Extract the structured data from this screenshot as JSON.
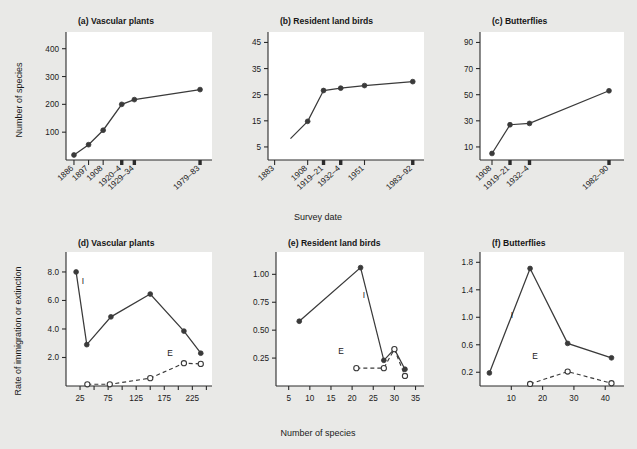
{
  "figure": {
    "background_color": "#e9e9e7",
    "plot_background_color": "#ffffff",
    "ink_color": "#3a3a3a",
    "shared_xlabel_top": "Survey date",
    "shared_xlabel_bottom": "Number of species",
    "ylabel_top": "Number of species",
    "ylabel_bottom": "Rate of immigration or extinction"
  },
  "chart_data": [
    {
      "id": "a",
      "type": "line",
      "title": "(a) Vascular plants",
      "xlabel": "Survey date",
      "ylabel": "Number of species",
      "categories": [
        "1886",
        "1897",
        "1908",
        "1920–4",
        "1929–34",
        "1979–83"
      ],
      "x": [
        1886,
        1897,
        1908,
        1922,
        1931.5,
        1981
      ],
      "values": [
        18,
        55,
        107,
        200,
        217,
        253
      ],
      "xlim": [
        1880,
        1990
      ],
      "ylim": [
        0,
        460
      ],
      "yticks": [
        100,
        200,
        300,
        400
      ],
      "ytick_labels": [
        "100",
        "200",
        "300",
        "400"
      ],
      "grid": false,
      "series": [
        {
          "name": "Number of species",
          "marker": "filled-circle",
          "line": "solid",
          "values": [
            18,
            55,
            107,
            200,
            217,
            253
          ]
        }
      ]
    },
    {
      "id": "b",
      "type": "line",
      "title": "(b) Resident land birds",
      "xlabel": "Survey date",
      "ylabel": "Number of species",
      "categories": [
        "1883",
        "1908",
        "1919–21",
        "1932–4",
        "1951",
        "1983–92"
      ],
      "x": [
        1883,
        1908,
        1920,
        1933,
        1951,
        1987.5
      ],
      "values": [
        null,
        14.8,
        26.6,
        27.5,
        28.5,
        30.0
      ],
      "note": "1883 point lies below the plotted axis range; the line enters from the lower left.",
      "xlim": [
        1878,
        1996
      ],
      "ylim": [
        0,
        49
      ],
      "yticks": [
        5,
        15,
        25,
        35,
        45
      ],
      "ytick_labels": [
        "5",
        "15",
        "25",
        "35",
        "45"
      ],
      "grid": false,
      "series": [
        {
          "name": "Number of species",
          "marker": "filled-circle",
          "line": "solid",
          "values": [
            null,
            14.8,
            26.6,
            27.5,
            28.5,
            30.0
          ]
        }
      ]
    },
    {
      "id": "c",
      "type": "line",
      "title": "(c) Butterflies",
      "xlabel": "Survey date",
      "ylabel": "Number of species",
      "categories": [
        "1908",
        "1919–21",
        "1932–4",
        "1982–90"
      ],
      "x": [
        1908,
        1920,
        1933,
        1986
      ],
      "values": [
        5,
        27,
        28,
        53
      ],
      "xlim": [
        1900,
        1996
      ],
      "ylim": [
        0,
        98
      ],
      "yticks": [
        10,
        30,
        50,
        70,
        90
      ],
      "ytick_labels": [
        "10",
        "30",
        "50",
        "70",
        "90"
      ],
      "grid": false,
      "series": [
        {
          "name": "Number of species",
          "marker": "filled-circle",
          "line": "solid",
          "values": [
            5,
            27,
            28,
            53
          ]
        }
      ]
    },
    {
      "id": "d",
      "type": "line",
      "title": "(d) Vascular plants",
      "xlabel": "Number of species",
      "ylabel": "Rate of immigration or extinction",
      "xlim": [
        0,
        260
      ],
      "ylim": [
        0,
        9.4
      ],
      "xticks": [
        25,
        75,
        125,
        175,
        225
      ],
      "xtick_labels": [
        "25",
        "75",
        "125",
        "175",
        "225"
      ],
      "xticks_minor": [
        50,
        100,
        150,
        200,
        250
      ],
      "yticks": [
        2.0,
        4.0,
        6.0,
        8.0
      ],
      "ytick_labels": [
        "2.0",
        "4.0",
        "6.0",
        "8.0"
      ],
      "grid": false,
      "series": [
        {
          "name": "I",
          "label": "I",
          "marker": "filled-circle",
          "line": "solid",
          "x": [
            18,
            37,
            80,
            150,
            210,
            240
          ],
          "values": [
            8.0,
            2.9,
            4.85,
            6.45,
            3.85,
            2.3
          ]
        },
        {
          "name": "E",
          "label": "E",
          "marker": "open-circle",
          "line": "dashed",
          "x": [
            38,
            78,
            150,
            210,
            240
          ],
          "values": [
            0.12,
            0.12,
            0.55,
            1.6,
            1.55
          ]
        }
      ]
    },
    {
      "id": "e",
      "type": "line",
      "title": "(e) Resident land birds",
      "xlabel": "Number of species",
      "ylabel": "Rate of immigration or extinction",
      "xlim": [
        2,
        37
      ],
      "ylim": [
        0,
        1.2
      ],
      "xticks": [
        5,
        10,
        15,
        20,
        25,
        30,
        35
      ],
      "xtick_labels": [
        "5",
        "10",
        "15",
        "20",
        "25",
        "30",
        "35"
      ],
      "yticks": [
        0.25,
        0.5,
        0.75,
        1.0
      ],
      "ytick_labels": [
        "0.25",
        "0.50",
        "0.75",
        "1.00"
      ],
      "grid": false,
      "series": [
        {
          "name": "I",
          "label": "I",
          "marker": "filled-circle",
          "line": "solid",
          "x": [
            7.5,
            22.0,
            27.5,
            30.0,
            32.5
          ],
          "values": [
            0.58,
            1.06,
            0.23,
            0.33,
            0.15
          ]
        },
        {
          "name": "E",
          "label": "E",
          "marker": "open-circle",
          "line": "dashed",
          "x": [
            21.0,
            27.5,
            30.0,
            32.5
          ],
          "values": [
            0.16,
            0.16,
            0.33,
            0.09
          ]
        }
      ]
    },
    {
      "id": "f",
      "type": "line",
      "title": "(f) Butterflies",
      "xlabel": "Number of species",
      "ylabel": "Rate of immigration or extinction",
      "xlim": [
        0,
        46
      ],
      "ylim": [
        0,
        1.95
      ],
      "xticks": [
        10,
        20,
        30,
        40
      ],
      "xtick_labels": [
        "10",
        "20",
        "30",
        "40"
      ],
      "yticks": [
        0.2,
        0.6,
        1.0,
        1.4,
        1.8
      ],
      "ytick_labels": [
        "0.2",
        "0.6",
        "1.0",
        "1.4",
        "1.8"
      ],
      "grid": false,
      "series": [
        {
          "name": "I",
          "label": "I",
          "marker": "filled-circle",
          "line": "solid",
          "x": [
            3.0,
            16.0,
            28.0,
            42.0
          ],
          "values": [
            0.19,
            1.71,
            0.62,
            0.41
          ]
        },
        {
          "name": "E",
          "label": "E",
          "marker": "open-circle",
          "line": "dashed",
          "x": [
            16.0,
            28.0,
            42.0
          ],
          "values": [
            0.03,
            0.21,
            0.04
          ]
        }
      ]
    }
  ]
}
